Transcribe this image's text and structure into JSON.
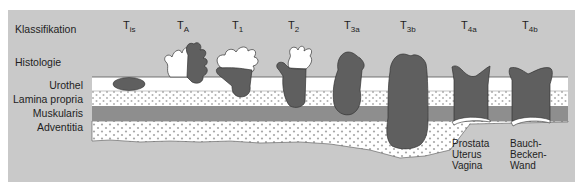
{
  "row_labels": {
    "classification": "Klassifikation",
    "histology": "Histologie"
  },
  "layers": [
    {
      "name": "Urothel",
      "pattern": "white"
    },
    {
      "name": "Lamina propria",
      "pattern": "dotted"
    },
    {
      "name": "Muskularis",
      "pattern": "solid-gray"
    },
    {
      "name": "Adventitia",
      "pattern": "dotted"
    }
  ],
  "stages": [
    {
      "base": "T",
      "sub": "is",
      "depth": "Urothel (flat, in situ)"
    },
    {
      "base": "T",
      "sub": "A",
      "depth": "papillary, non-invasive"
    },
    {
      "base": "T",
      "sub": "1",
      "depth": "Lamina propria"
    },
    {
      "base": "T",
      "sub": "2",
      "depth": "Muskularis (superficial)"
    },
    {
      "base": "T",
      "sub": "3a",
      "depth": "Muskularis (deep)"
    },
    {
      "base": "T",
      "sub": "3b",
      "depth": "Adventitia"
    },
    {
      "base": "T",
      "sub": "4a",
      "depth": "adjacent organs"
    },
    {
      "base": "T",
      "sub": "4b",
      "depth": "pelvic/abdominal wall"
    }
  ],
  "organ_labels": {
    "t4a": [
      "Prostata",
      "Uterus",
      "Vagina"
    ],
    "t4b": [
      "Bauch-",
      "Becken-",
      "Wand"
    ]
  },
  "colors": {
    "background": "#c9c9c9",
    "tumor": "#5f5f5f",
    "muscularis": "#8e8e8e",
    "urothel": "#ffffff",
    "dots": "#b5b5b5"
  }
}
